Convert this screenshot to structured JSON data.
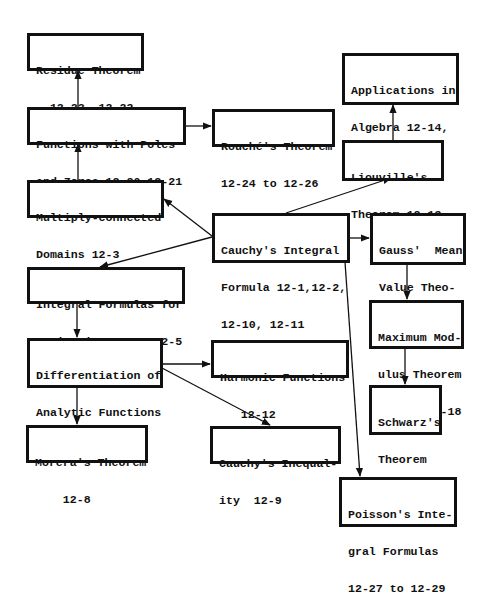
{
  "diagram": {
    "type": "flowchart",
    "nodes": [
      {
        "id": "residue",
        "lines": [
          "Residue Theorem",
          "  12-22, 12-23"
        ]
      },
      {
        "id": "poles_zeros",
        "lines": [
          "Functions with Poles",
          "and Zeros 12-20,12-21"
        ]
      },
      {
        "id": "rouche",
        "lines": [
          "Rouché's Theorem",
          "12-24 to 12-26"
        ]
      },
      {
        "id": "algebra",
        "lines": [
          "Applications in",
          "Algebra 12-14,",
          "12-15"
        ]
      },
      {
        "id": "liouville",
        "lines": [
          "Liouville's",
          "Theorem 12-13"
        ]
      },
      {
        "id": "multiply_connected",
        "lines": [
          "Multiply-connected",
          "Domains 12-3"
        ]
      },
      {
        "id": "cauchy_integral",
        "lines": [
          "Cauchy's Integral",
          "Formula 12-1,12-2,",
          "12-10, 12-11"
        ]
      },
      {
        "id": "gauss",
        "lines": [
          "Gauss'  Mean",
          "Value Theo-",
          "rem 12-16"
        ]
      },
      {
        "id": "integral_derivatives",
        "lines": [
          "Integral Formulas for",
          "Derivatives 12-4,12-5"
        ]
      },
      {
        "id": "differentiation",
        "lines": [
          "Differentiation of",
          "Analytic Functions",
          "    12-6,12-7"
        ]
      },
      {
        "id": "harmonic",
        "lines": [
          "Harmonic Functions",
          "   12-12"
        ]
      },
      {
        "id": "max_modulus",
        "lines": [
          "Maximum Mod-",
          "ulus Theorem",
          "12-17, 12-18"
        ]
      },
      {
        "id": "schwarz",
        "lines": [
          "Schwarz's",
          "Theorem",
          "12-19"
        ]
      },
      {
        "id": "morera",
        "lines": [
          "Morera's Theorem",
          "    12-8"
        ]
      },
      {
        "id": "cauchy_inequality",
        "lines": [
          "Cauchy's Inequal-",
          "ity  12-9"
        ]
      },
      {
        "id": "poisson",
        "lines": [
          "Poisson's Inte-",
          "gral Formulas",
          "12-27 to 12-29"
        ]
      }
    ],
    "edges": [
      {
        "from": "poles_zeros",
        "to": "residue"
      },
      {
        "from": "poles_zeros",
        "to": "rouche"
      },
      {
        "from": "multiply_connected",
        "to": "poles_zeros"
      },
      {
        "from": "cauchy_integral",
        "to": "multiply_connected"
      },
      {
        "from": "cauchy_integral",
        "to": "liouville"
      },
      {
        "from": "liouville",
        "to": "algebra"
      },
      {
        "from": "cauchy_integral",
        "to": "gauss"
      },
      {
        "from": "cauchy_integral",
        "to": "integral_derivatives"
      },
      {
        "from": "cauchy_integral",
        "to": "poisson"
      },
      {
        "from": "gauss",
        "to": "max_modulus"
      },
      {
        "from": "max_modulus",
        "to": "schwarz"
      },
      {
        "from": "integral_derivatives",
        "to": "differentiation"
      },
      {
        "from": "differentiation",
        "to": "harmonic"
      },
      {
        "from": "differentiation",
        "to": "cauchy_inequality"
      },
      {
        "from": "differentiation",
        "to": "morera"
      }
    ]
  }
}
